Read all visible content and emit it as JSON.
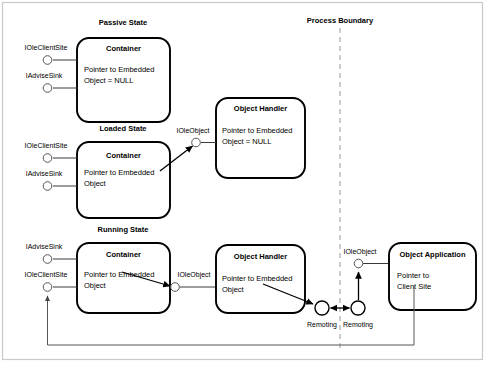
{
  "diagram": {
    "process_boundary_label": "Process Boundary",
    "states": [
      {
        "id": "passive",
        "label": "Passive State"
      },
      {
        "id": "loaded",
        "label": "Loaded State"
      },
      {
        "id": "running",
        "label": "Running State"
      }
    ],
    "boxes": [
      {
        "id": "passive-container",
        "title": "Container",
        "body_line1": "Pointer to Embedded",
        "body_line2": "Object = NULL"
      },
      {
        "id": "passive-object-handler",
        "title": "Object Handler",
        "body_line1": "Pointer to Embedded",
        "body_line2": "Object = NULL"
      },
      {
        "id": "loaded-container",
        "title": "Container",
        "body_line1": "Pointer to Embedded",
        "body_line2": "Object"
      },
      {
        "id": "running-container",
        "title": "Container",
        "body_line1": "Pointer to Embedded",
        "body_line2": "Object"
      },
      {
        "id": "running-object-handler",
        "title": "Object Handler",
        "body_line1": "Pointer to Embedded",
        "body_line2": "Object"
      },
      {
        "id": "object-application",
        "title": "Object Application",
        "body_line1": "Pointer to",
        "body_line2": "Client Site"
      }
    ],
    "interfaces": [
      {
        "id": "passive-iolecientsite",
        "label": "IOleClientSite"
      },
      {
        "id": "passive-iadvisesink",
        "label": "IAdviseSink"
      },
      {
        "id": "loaded-iolecientsite",
        "label": "IOleClientSite"
      },
      {
        "id": "loaded-iadvisesink",
        "label": "IAdviseSink"
      },
      {
        "id": "loaded-ioleobject",
        "label": "IOleObject"
      },
      {
        "id": "running-iadvisesink",
        "label": "IAdviseSink"
      },
      {
        "id": "running-iolecientsite",
        "label": "IOleClientSite"
      },
      {
        "id": "running-ioleobject",
        "label": "IOleObject"
      },
      {
        "id": "app-ioleobject",
        "label": "IOleObject"
      }
    ],
    "remoting": [
      {
        "id": "remoting-left",
        "label": "Remoting"
      },
      {
        "id": "remoting-right",
        "label": "Remoting"
      }
    ],
    "colors": {
      "stroke": "#000000",
      "connector": "#3a3a3a",
      "boundary": "#9a9a9a",
      "frame": "#c9c9c9",
      "background": "#ffffff"
    }
  }
}
